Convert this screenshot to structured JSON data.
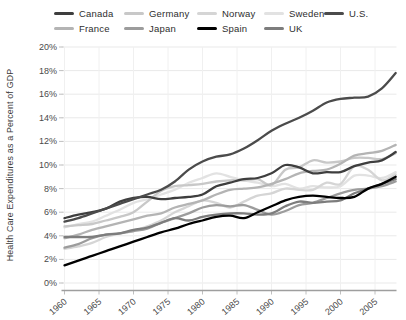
{
  "chart_data": {
    "type": "line",
    "title": "",
    "xlabel": "",
    "ylabel": "Health Care Expenditures as a Percent of GDP",
    "x": [
      1960,
      1962,
      1964,
      1966,
      1968,
      1970,
      1972,
      1974,
      1976,
      1978,
      1980,
      1982,
      1984,
      1986,
      1988,
      1990,
      1992,
      1994,
      1996,
      1998,
      2000,
      2002,
      2004,
      2006,
      2008
    ],
    "x_tick_labels": [
      "1960",
      "1965",
      "1970",
      "1975",
      "1980",
      "1985",
      "1990",
      "1995",
      "2000",
      "2005"
    ],
    "y_tick_labels": [
      "0%",
      "2%",
      "4%",
      "6%",
      "8%",
      "10%",
      "12%",
      "14%",
      "16%",
      "18%",
      "20%"
    ],
    "xlim": [
      1960,
      2008
    ],
    "ylim": [
      0,
      20
    ],
    "grid": true,
    "legend_position": "top",
    "legend_rows": [
      [
        "Canada",
        "Germany",
        "Norway",
        "Sweden",
        "U.S."
      ],
      [
        "France",
        "Japan",
        "Spain",
        "UK"
      ]
    ],
    "draw_order": [
      "Sweden",
      "Norway",
      "Germany",
      "France",
      "Japan",
      "UK",
      "Canada",
      "U.S.",
      "Spain"
    ],
    "series": [
      {
        "name": "Canada",
        "color": "#3e3e3e",
        "values": [
          5.5,
          5.8,
          6.0,
          6.3,
          6.9,
          7.2,
          7.3,
          7.1,
          7.2,
          7.3,
          7.5,
          8.2,
          8.5,
          8.8,
          8.9,
          9.3,
          10.0,
          9.8,
          9.3,
          9.4,
          9.4,
          9.9,
          10.2,
          10.4,
          11.1
        ]
      },
      {
        "name": "France",
        "color": "#b4b4b4",
        "values": [
          3.8,
          4.1,
          4.5,
          4.8,
          5.1,
          5.4,
          5.7,
          5.9,
          6.4,
          6.7,
          7.0,
          7.5,
          7.9,
          8.0,
          8.1,
          8.4,
          8.8,
          9.3,
          9.5,
          9.6,
          10.1,
          10.8,
          11.0,
          11.2,
          11.7
        ]
      },
      {
        "name": "Germany",
        "color": "#c8c8c8",
        "values": [
          4.8,
          4.9,
          5.0,
          5.3,
          5.6,
          6.0,
          6.9,
          7.8,
          8.2,
          8.3,
          8.4,
          8.6,
          8.7,
          8.7,
          8.8,
          8.3,
          9.6,
          9.8,
          10.4,
          10.2,
          10.3,
          10.6,
          10.6,
          10.5,
          11.0
        ]
      },
      {
        "name": "Japan",
        "color": "#9c9c9c",
        "values": [
          3.0,
          3.3,
          3.8,
          4.1,
          4.2,
          4.4,
          4.6,
          5.1,
          5.5,
          5.9,
          6.4,
          6.6,
          6.5,
          6.6,
          6.2,
          5.8,
          6.1,
          6.6,
          6.8,
          7.2,
          7.6,
          7.9,
          8.0,
          8.2,
          8.6
        ]
      },
      {
        "name": "Norway",
        "color": "#d5d5d5",
        "values": [
          2.9,
          3.1,
          3.4,
          3.9,
          4.2,
          4.4,
          4.8,
          5.3,
          6.0,
          6.5,
          7.0,
          6.8,
          6.4,
          6.9,
          7.4,
          7.6,
          8.0,
          7.9,
          7.9,
          8.5,
          8.4,
          9.9,
          9.6,
          8.7,
          9.2
        ]
      },
      {
        "name": "Spain",
        "color": "#000000",
        "values": [
          1.5,
          1.9,
          2.3,
          2.7,
          3.1,
          3.5,
          3.9,
          4.3,
          4.6,
          5.0,
          5.3,
          5.6,
          5.7,
          5.5,
          6.0,
          6.5,
          7.0,
          7.3,
          7.4,
          7.3,
          7.2,
          7.3,
          8.0,
          8.4,
          9.0
        ]
      },
      {
        "name": "Sweden",
        "color": "#e2e2e2",
        "values": [
          4.7,
          5.0,
          5.2,
          5.7,
          6.2,
          6.8,
          7.1,
          7.5,
          7.9,
          8.5,
          8.9,
          9.3,
          9.0,
          8.7,
          8.5,
          8.2,
          8.4,
          8.0,
          8.2,
          8.1,
          8.2,
          9.1,
          9.1,
          8.9,
          9.4
        ]
      },
      {
        "name": "UK",
        "color": "#7d7d7d",
        "values": [
          3.9,
          3.9,
          3.9,
          4.1,
          4.2,
          4.5,
          4.7,
          5.1,
          5.5,
          5.3,
          5.6,
          5.8,
          5.9,
          5.9,
          5.8,
          5.9,
          6.5,
          6.9,
          6.8,
          6.9,
          7.0,
          7.6,
          8.0,
          8.4,
          8.8
        ]
      },
      {
        "name": "U.S.",
        "color": "#4b4b4b",
        "values": [
          5.2,
          5.5,
          5.9,
          6.3,
          6.7,
          7.1,
          7.5,
          7.9,
          8.6,
          9.6,
          10.3,
          10.7,
          10.9,
          11.4,
          12.1,
          12.9,
          13.5,
          14.0,
          14.6,
          15.3,
          15.6,
          15.7,
          15.8,
          16.5,
          17.8
        ]
      }
    ]
  }
}
